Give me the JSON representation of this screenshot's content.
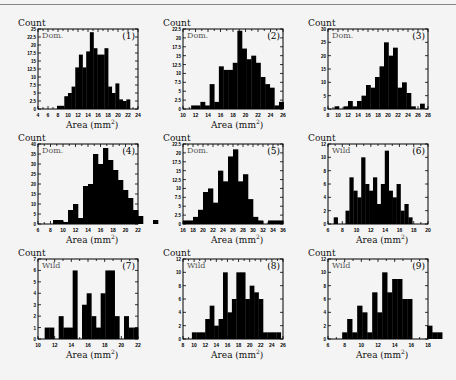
{
  "figure": {
    "ylabel": "Count",
    "xlabel": "Area (mm",
    "xlabel_sup": "2",
    "xlabel_end": ")"
  },
  "chart_data": [
    {
      "type": "bar",
      "panel": "(1)",
      "group": "Dom.",
      "xlabel": "Area (mm²)",
      "ylabel": "Count",
      "xlim": [
        4,
        24
      ],
      "xticks": [
        4,
        6,
        8,
        10,
        12,
        14,
        16,
        18,
        20,
        22,
        24
      ],
      "ylim": [
        0,
        25
      ],
      "yticks": [
        0,
        2.5,
        5,
        7.5,
        10,
        12.5,
        15,
        17.5,
        20,
        22.5,
        25
      ],
      "bin_start": 7.8,
      "bin_width": 0.73,
      "values": [
        1,
        1,
        4,
        5,
        7,
        13,
        17,
        13,
        18,
        24,
        19,
        17,
        17,
        19,
        7,
        5,
        8,
        3,
        2.5,
        3
      ]
    },
    {
      "type": "bar",
      "panel": "(2)",
      "group": "Dom.",
      "xlabel": "Area (mm²)",
      "ylabel": "Count",
      "xlim": [
        10,
        26
      ],
      "xticks": [
        10,
        12,
        14,
        16,
        18,
        20,
        22,
        24,
        26
      ],
      "ylim": [
        0,
        22.5
      ],
      "yticks": [
        0,
        2.5,
        5,
        7.5,
        10,
        12.5,
        15,
        17.5,
        20,
        22.5
      ],
      "bin_start": 11.3,
      "bin_width": 0.74,
      "values": [
        1,
        1,
        2,
        1,
        7,
        2,
        12,
        11,
        11,
        13,
        22,
        17,
        14,
        15,
        13,
        9,
        7,
        6,
        1,
        2
      ]
    },
    {
      "type": "bar",
      "panel": "(3)",
      "group": "Dom.",
      "xlabel": "",
      "ylabel": "Count",
      "xlim": [
        8,
        28
      ],
      "xticks": [
        8,
        10,
        12,
        14,
        16,
        18,
        20,
        22,
        24,
        26,
        28
      ],
      "ylim": [
        0,
        30
      ],
      "yticks": [
        0,
        5,
        10,
        15,
        20,
        25,
        30
      ],
      "bin_start": 9.3,
      "bin_width": 0.9,
      "values": [
        1,
        0,
        1,
        3,
        1,
        3,
        5,
        9,
        8,
        12,
        16,
        25,
        20,
        23,
        8,
        10,
        6,
        1,
        0,
        2
      ]
    },
    {
      "type": "bar",
      "panel": "(4)",
      "group": "Dom.",
      "xlabel": "Area (mm²)",
      "ylabel": "Count",
      "xlim": [
        6,
        22
      ],
      "xticks": [
        6,
        8,
        10,
        12,
        14,
        16,
        18,
        20,
        22
      ],
      "ylim": [
        0,
        40
      ],
      "yticks": [
        0,
        5,
        10,
        15,
        20,
        25,
        30,
        35,
        40
      ],
      "bin_start": 6,
      "bin_width": 0.8,
      "values": [
        0,
        0,
        0,
        2,
        2,
        1,
        7,
        10,
        3,
        19,
        20,
        35,
        30,
        38,
        32,
        27,
        22,
        17,
        13,
        7,
        4,
        0,
        0,
        2,
        0
      ]
    },
    {
      "type": "bar",
      "panel": "(5)",
      "group": "Dom.",
      "xlabel": "Area (mm²)",
      "ylabel": "Count",
      "xlim": [
        16,
        36
      ],
      "xticks": [
        16,
        18,
        20,
        22,
        24,
        26,
        28,
        30,
        32,
        34,
        36
      ],
      "ylim": [
        0,
        22.5
      ],
      "yticks": [
        0,
        2.5,
        5,
        7.5,
        10,
        12.5,
        15,
        17.5,
        20,
        22.5
      ],
      "bin_start": 16,
      "bin_width": 1.0,
      "values": [
        1,
        1,
        2,
        4,
        9,
        10,
        6,
        15,
        12,
        19,
        21,
        12,
        14,
        7,
        2,
        1,
        0,
        1,
        1,
        1
      ]
    },
    {
      "type": "bar",
      "panel": "(6)",
      "group": "Wild",
      "xlabel": "Area (mm²)",
      "ylabel": "Count",
      "xlim": [
        6,
        20
      ],
      "xticks": [
        6,
        8,
        10,
        12,
        14,
        16,
        18,
        20
      ],
      "ylim": [
        0,
        12
      ],
      "yticks": [
        0,
        2,
        4,
        6,
        8,
        10,
        12
      ],
      "bin_start": 6.8,
      "bin_width": 0.55,
      "values": [
        1,
        0,
        0,
        2,
        7,
        5,
        4,
        10,
        6,
        5,
        7,
        3,
        6,
        11,
        5,
        4,
        6,
        2,
        3,
        1
      ]
    },
    {
      "type": "bar",
      "panel": "(7)",
      "group": "Wild",
      "xlabel": "Area (mm²)",
      "ylabel": "Count",
      "xlim": [
        10,
        22
      ],
      "xticks": [
        10,
        12,
        14,
        16,
        18,
        20,
        22
      ],
      "ylim": [
        0,
        7
      ],
      "yticks": [
        0,
        1,
        2,
        3,
        4,
        5,
        6,
        7
      ],
      "bin_start": 10.8,
      "bin_width": 0.56,
      "values": [
        1,
        1,
        0,
        2,
        1,
        1,
        6,
        0,
        3,
        4,
        2,
        1,
        4,
        6,
        6,
        2,
        0,
        2,
        1,
        1
      ]
    },
    {
      "type": "bar",
      "panel": "(8)",
      "group": "Wild",
      "xlabel": "Area (mm²)",
      "ylabel": "Count",
      "xlim": [
        8,
        26
      ],
      "xticks": [
        8,
        10,
        12,
        14,
        16,
        18,
        20,
        22,
        24,
        26
      ],
      "ylim": [
        0,
        12
      ],
      "yticks": [
        0,
        2,
        4,
        6,
        8,
        10,
        12
      ],
      "bin_start": 9.6,
      "bin_width": 0.8,
      "values": [
        1,
        1,
        1,
        3,
        5,
        2,
        3,
        10,
        4,
        6,
        10,
        10,
        6,
        8,
        7,
        6,
        1,
        1,
        1,
        1
      ]
    },
    {
      "type": "bar",
      "panel": "(9)",
      "group": "Wild",
      "xlabel": "Area (mm²)",
      "ylabel": "Count",
      "xlim": [
        6,
        18
      ],
      "xticks": [
        6,
        8,
        10,
        12,
        14,
        16,
        18
      ],
      "ylim": [
        0,
        12
      ],
      "yticks": [
        0,
        2,
        4,
        6,
        8,
        10,
        12
      ],
      "bin_start": 7.7,
      "bin_width": 0.6,
      "values": [
        1,
        3,
        1,
        5,
        4,
        1,
        7,
        4,
        10,
        7,
        9,
        9,
        6,
        6,
        0,
        0,
        0,
        2,
        1,
        1
      ]
    }
  ]
}
